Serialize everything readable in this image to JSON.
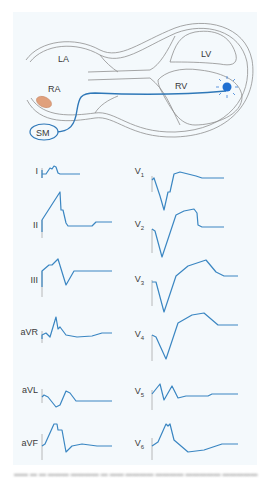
{
  "diagram": {
    "heart_labels": {
      "la": "LA",
      "ra": "RA",
      "lv": "LV",
      "rv": "RV",
      "sm": "SM"
    },
    "colors": {
      "trace": "#3a86c2",
      "lead_wire": "#2f78b8",
      "electrode": "#1f6fd1",
      "sinus_node": "#e0a07c",
      "outline": "#8a8a8a",
      "baseline_marker": "#a8a8a8"
    },
    "leads_left": [
      {
        "id": "I",
        "label": "I"
      },
      {
        "id": "II",
        "label": "II"
      },
      {
        "id": "III",
        "label": "III"
      },
      {
        "id": "aVR",
        "label": "aVR"
      },
      {
        "id": "aVL",
        "label": "aVL"
      },
      {
        "id": "aVF",
        "label": "aVF"
      }
    ],
    "leads_right": [
      {
        "id": "V1",
        "label": "V",
        "sub": "1"
      },
      {
        "id": "V2",
        "label": "V",
        "sub": "2"
      },
      {
        "id": "V3",
        "label": "V",
        "sub": "3"
      },
      {
        "id": "V4",
        "label": "V",
        "sub": "4"
      },
      {
        "id": "V5",
        "label": "V",
        "sub": "5"
      },
      {
        "id": "V6",
        "label": "V",
        "sub": "6"
      }
    ]
  }
}
